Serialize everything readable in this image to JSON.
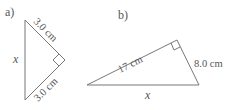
{
  "figures": [
    {
      "label": "a)",
      "side_top": "3.0 cm",
      "side_bottom": "3.0 cm",
      "hypotenuse": "x",
      "right_angle": true
    },
    {
      "label": "b)",
      "hypotenuse": "17 cm",
      "side_right": "8.0 cm",
      "base": "x",
      "right_angle": true
    }
  ],
  "colors": {
    "line": "#666666",
    "text": "#555555",
    "background": "#ffffff"
  }
}
